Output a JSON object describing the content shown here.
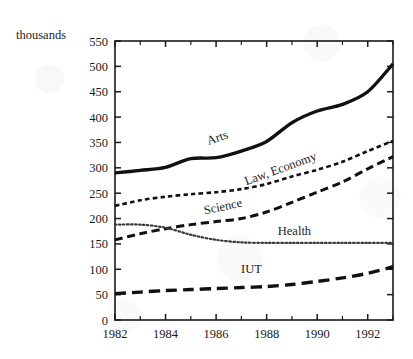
{
  "chart_data": {
    "type": "line",
    "title": "",
    "subtitle": "",
    "xlabel": "",
    "ylabel": "thousands",
    "unit_label": "thousands",
    "xlim": [
      1982,
      1993
    ],
    "ylim": [
      0,
      550
    ],
    "y_ticks": [
      0,
      50,
      100,
      150,
      200,
      250,
      300,
      350,
      400,
      450,
      500,
      550
    ],
    "y_tick_labels": [
      "0",
      "50",
      "100",
      "150",
      "200",
      "250",
      "300",
      "350",
      "400",
      "450",
      "500",
      "550"
    ],
    "x_ticks": [
      1982,
      1984,
      1986,
      1988,
      1990,
      1992
    ],
    "x_tick_labels": [
      "1982",
      "1984",
      "1986",
      "1988",
      "1990",
      "1992"
    ],
    "x_minor_ticks": [
      1983,
      1985,
      1987,
      1989,
      1991,
      1993
    ],
    "grid": false,
    "legend": "inline-labels",
    "frame": "box-with-ticks-all-sides",
    "x": [
      1982,
      1983,
      1984,
      1985,
      1986,
      1987,
      1988,
      1989,
      1990,
      1991,
      1992,
      1993
    ],
    "series": [
      {
        "name": "Arts",
        "label": "Arts",
        "style": "solid",
        "width": 3.4,
        "color": "#111111",
        "values": [
          290,
          295,
          301,
          318,
          320,
          333,
          352,
          389,
          412,
          425,
          450,
          505
        ],
        "label_x": 1986.1,
        "label_y": 352,
        "label_rotation": -19
      },
      {
        "name": "Law, Economy",
        "label": "Law, Economy",
        "style": "short-dash",
        "width": 2.6,
        "color": "#111111",
        "values": [
          225,
          236,
          243,
          248,
          252,
          258,
          268,
          283,
          296,
          312,
          333,
          353
        ],
        "label_x": 1988.6,
        "label_y": 291,
        "label_rotation": -20
      },
      {
        "name": "Science",
        "label": "Science",
        "style": "long-dash",
        "width": 3.0,
        "color": "#111111",
        "values": [
          158,
          170,
          180,
          188,
          194,
          200,
          213,
          232,
          252,
          272,
          298,
          322
        ],
        "label_x": 1986.3,
        "label_y": 216,
        "label_rotation": -12
      },
      {
        "name": "Health",
        "label": "Health",
        "style": "dotted",
        "width": 2.2,
        "color": "#3a3a3a",
        "values": [
          188,
          188,
          182,
          168,
          158,
          153,
          152,
          152,
          152,
          152,
          152,
          152
        ],
        "label_x": 1989.1,
        "label_y": 168,
        "label_rotation": 0
      },
      {
        "name": "IUT",
        "label": "IUT",
        "style": "dash-long",
        "width": 3.4,
        "color": "#111111",
        "values": [
          52,
          55,
          58,
          60,
          62,
          64,
          66,
          70,
          76,
          83,
          92,
          105
        ],
        "label_x": 1987.4,
        "label_y": 93,
        "label_rotation": 0
      }
    ]
  },
  "axes": {
    "unit_label": "thousands",
    "plot_left_px": 115,
    "plot_right_px": 393,
    "plot_top_px": 41,
    "plot_bottom_px": 320
  }
}
